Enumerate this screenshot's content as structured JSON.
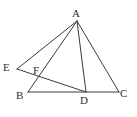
{
  "figure": {
    "background_color": "#ffffff",
    "stroke_color": "#3b3b41",
    "label_color": "#2f2f34",
    "width": 137,
    "height": 117
  },
  "points": [
    {
      "id": "A",
      "label": "A",
      "x": 77,
      "y": 21,
      "label_x": 72,
      "label_y": 8
    },
    {
      "id": "E",
      "label": "E",
      "x": 17,
      "y": 69,
      "label_x": 3,
      "label_y": 62
    },
    {
      "id": "F",
      "label": "F",
      "x": 44,
      "y": 72,
      "label_x": 33,
      "label_y": 65
    },
    {
      "id": "B",
      "label": "B",
      "x": 28,
      "y": 92,
      "label_x": 16,
      "label_y": 90
    },
    {
      "id": "D",
      "label": "D",
      "x": 86,
      "y": 92,
      "label_x": 80,
      "label_y": 95
    },
    {
      "id": "C",
      "label": "C",
      "x": 119,
      "y": 92,
      "label_x": 120,
      "label_y": 88
    }
  ],
  "segments": [
    {
      "id": "AE",
      "from": "A",
      "to": "E",
      "name": "segment-a-e"
    },
    {
      "id": "AB",
      "from": "A",
      "to": "B",
      "name": "segment-a-b"
    },
    {
      "id": "AD",
      "from": "A",
      "to": "D",
      "name": "segment-a-d"
    },
    {
      "id": "AC",
      "from": "A",
      "to": "C",
      "name": "segment-a-c"
    },
    {
      "id": "ED",
      "from": "E",
      "to": "D",
      "name": "segment-e-d"
    },
    {
      "id": "BC",
      "from": "B",
      "to": "C",
      "name": "segment-b-c"
    }
  ]
}
